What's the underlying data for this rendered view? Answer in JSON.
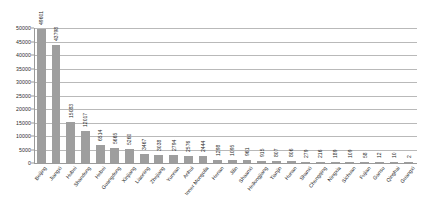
{
  "chart_data": {
    "type": "bar",
    "title": "",
    "subtitle": "",
    "xlabel": "",
    "ylabel": "",
    "ylim": [
      0,
      50000
    ],
    "y_ticks": [
      0,
      5000,
      10000,
      15000,
      20000,
      25000,
      30000,
      35000,
      40000,
      45000,
      50000
    ],
    "grid": true,
    "legend": "none",
    "bar_color": "#9e9e9e",
    "gridline_color": "#b9b9b9",
    "axis_color": "#9a9a9a",
    "categories": [
      "Beijing",
      "Jiangxi",
      "Hubei",
      "Shandong",
      "Hebei",
      "Guangdong",
      "Xinjiang",
      "Liaoning",
      "Zhejiang",
      "Yunnan",
      "Anhui",
      "Inner Mongolia",
      "Henan",
      "Jilin",
      "Shaanxi",
      "Heilongjiang",
      "Tianjin",
      "Hunan",
      "Shanxi",
      "Chongqing",
      "Ningxia",
      "Sichuan",
      "Fujian",
      "Gansu",
      "Qinghai",
      "Guangxi"
    ],
    "values": [
      49601,
      43798,
      15083,
      12017,
      6514,
      5665,
      5260,
      3467,
      3038,
      2794,
      2576,
      2444,
      1298,
      1095,
      961,
      915,
      807,
      806,
      279,
      216,
      189,
      109,
      58,
      12,
      10,
      2
    ],
    "value_labels": [
      "49601",
      "43798",
      "15083",
      "12017",
      "6514",
      "5665",
      "5260",
      "3467",
      "3038",
      "2794",
      "2576",
      "2444",
      "1298",
      "1095",
      "961",
      "915",
      "807",
      "806",
      "279",
      "216",
      "189",
      "109",
      "58",
      "12",
      "10",
      "2"
    ],
    "y_tick_labels": [
      "0",
      "5000",
      "10000",
      "15000",
      "20000",
      "25000",
      "30000",
      "35000",
      "40000",
      "45000",
      "50000"
    ]
  }
}
